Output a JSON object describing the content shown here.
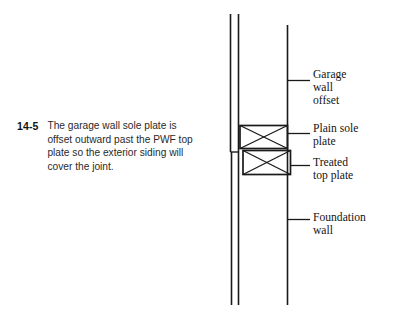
{
  "figure": {
    "number": "14-5",
    "caption_lines": [
      "The garage wall sole plate is",
      "offset outward past the PWF top",
      "plate so the exterior siding will",
      "cover the joint."
    ],
    "caption_full": "The garage wall sole plate is offset outward past the PWF top plate so the exterior siding will cover the joint."
  },
  "labels": {
    "garage_wall_offset": [
      "Garage",
      "wall",
      "offset"
    ],
    "plain_sole_plate": [
      "Plain sole",
      "plate"
    ],
    "treated_top_plate": [
      "Treated",
      "top plate"
    ],
    "foundation_wall": [
      "Foundation",
      "wall"
    ]
  },
  "colors": {
    "background": "#ffffff",
    "line": "#1a1a1a",
    "caption_text": "#2a2a2a",
    "label_text": "#141414"
  }
}
